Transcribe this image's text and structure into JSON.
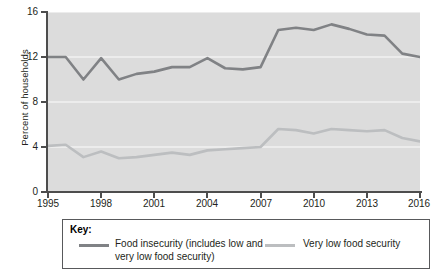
{
  "axis": {
    "ylabel": "Percent of households",
    "yticks": [
      "0",
      "4",
      "8",
      "12",
      "16"
    ],
    "xticks": [
      "1995",
      "1998",
      "2001",
      "2004",
      "2007",
      "2010",
      "2013",
      "2016"
    ]
  },
  "legend": {
    "title": "Key:",
    "entries": [
      {
        "label": "Food insecurity (includes low and very low food security)",
        "color": "#808285"
      },
      {
        "label": "Very low food security",
        "color": "#bcbec0"
      }
    ]
  },
  "colors": {
    "plot_background": "#dcdcdc",
    "gridline": "#f2f2f2",
    "axis": "#4d4d4d",
    "series_food_insecurity": "#808285",
    "series_very_low": "#bcbec0",
    "legend_border": "#58595b",
    "text": "#231f20"
  },
  "chart_data": {
    "type": "line",
    "title": "",
    "xlabel": "",
    "ylabel": "Percent of households",
    "xlim": [
      1995,
      2016
    ],
    "ylim": [
      0,
      16
    ],
    "yticks": [
      0,
      4,
      8,
      12,
      16
    ],
    "xticks": [
      1995,
      1998,
      2001,
      2004,
      2007,
      2010,
      2013,
      2016
    ],
    "grid": true,
    "grid_axis": "y",
    "legend_position": "below-plot",
    "x": [
      1995,
      1996,
      1997,
      1998,
      1999,
      2000,
      2001,
      2002,
      2003,
      2004,
      2005,
      2006,
      2007,
      2008,
      2009,
      2010,
      2011,
      2012,
      2013,
      2014,
      2015,
      2016
    ],
    "series": [
      {
        "name": "Food insecurity (includes low and very low food security)",
        "color": "#808285",
        "values": [
          12.0,
          12.0,
          10.0,
          11.9,
          10.0,
          10.5,
          10.7,
          11.1,
          11.1,
          11.9,
          11.0,
          10.9,
          11.1,
          14.4,
          14.6,
          14.4,
          14.9,
          14.5,
          14.0,
          13.9,
          12.3,
          12.0
        ]
      },
      {
        "name": "Very low food security",
        "color": "#bcbec0",
        "values": [
          4.1,
          4.2,
          3.1,
          3.6,
          3.0,
          3.1,
          3.3,
          3.5,
          3.3,
          3.7,
          3.8,
          3.9,
          4.0,
          5.6,
          5.5,
          5.2,
          5.6,
          5.5,
          5.4,
          5.5,
          4.8,
          4.5
        ]
      }
    ]
  }
}
